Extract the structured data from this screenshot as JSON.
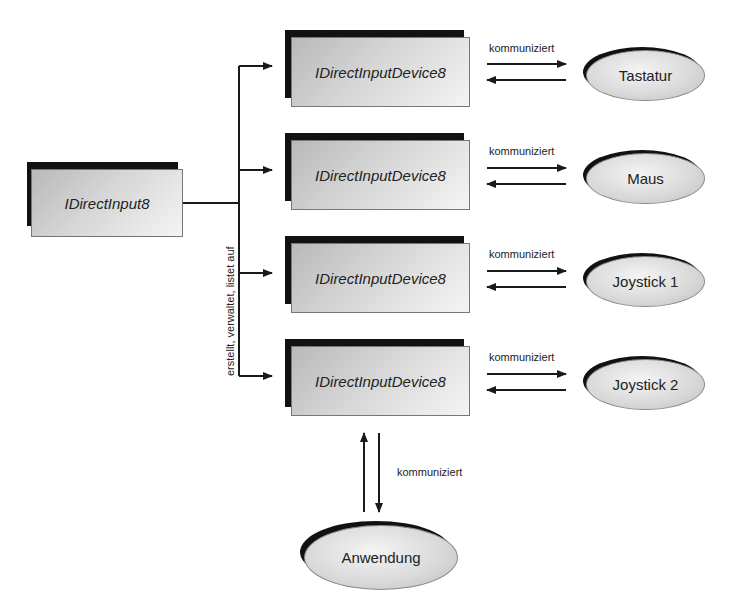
{
  "root": {
    "label": "IDirectInput8"
  },
  "relation_label": "erstellt, verwaltet, listet auf",
  "devices": [
    {
      "interface": "IDirectInputDevice8",
      "link_label": "kommuniziert",
      "target": "Tastatur"
    },
    {
      "interface": "IDirectInputDevice8",
      "link_label": "kommuniziert",
      "target": "Maus"
    },
    {
      "interface": "IDirectInputDevice8",
      "link_label": "kommuniziert",
      "target": "Joystick 1"
    },
    {
      "interface": "IDirectInputDevice8",
      "link_label": "kommuniziert",
      "target": "Joystick 2"
    }
  ],
  "application": {
    "label": "Anwendung",
    "link_label": "kommuniziert"
  },
  "colors": {
    "shadow": "#111111",
    "box_fill_start": "#b9b9b9",
    "box_fill_end": "#f4f4f4",
    "line": "#1a1a1a"
  }
}
